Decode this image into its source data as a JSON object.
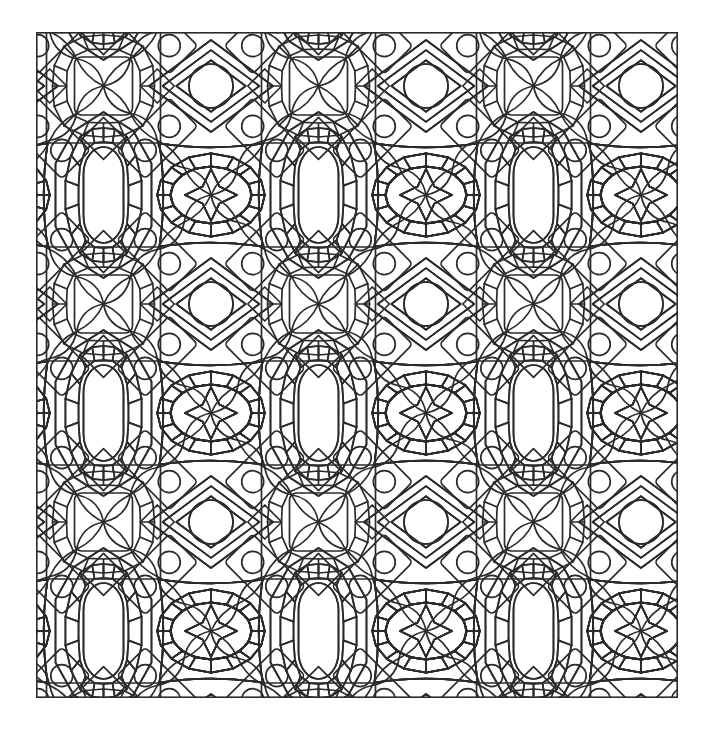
{
  "document": {
    "kind": "coloring-page",
    "title": "Geometric Tessellation Pattern",
    "canvas_width": 713,
    "canvas_height": 732,
    "background_color": "#ffffff"
  },
  "frame": {
    "x": 36,
    "y": 32,
    "width": 642,
    "height": 666,
    "stroke_color": "#2b2b2b",
    "stroke_width": 1.6,
    "fill": "none"
  },
  "artwork": {
    "style": "line-art outline, uncolored",
    "line_color": "#2b2b2b",
    "line_width": 1.7,
    "fill_color": "none",
    "symmetry": "p4m reflective lattice",
    "tile_width": 215,
    "tile_height": 218,
    "tile_origin_x": -40,
    "tile_origin_y": -55,
    "columns": 4,
    "rows": 4,
    "motifs": [
      {
        "name": "ellipse-medallion",
        "description": "horizontal oval ringed by trapezoid voussoirs inside a lobed square",
        "ellipse_rx": 40,
        "ellipse_ry": 28,
        "ring_segments": 16,
        "ring_thickness": 13,
        "lattice_offset_x": 0,
        "lattice_offset_y": 0
      },
      {
        "name": "square-medallion",
        "description": "rounded square panel ringed by brick voussoirs inside a square frame",
        "panel_half": 33,
        "ring_segments": 16,
        "ring_thickness": 14,
        "lattice_offset_x": 107.5,
        "lattice_offset_y": 109
      },
      {
        "name": "vertical-cartouche",
        "description": "tall capsule ringed by voussoirs, pointed top and bottom",
        "capsule_rx": 20,
        "capsule_ry": 48,
        "ring_segments": 18,
        "ring_thickness": 14,
        "lattice_offset_x": 107.5,
        "lattice_offset_y": 0
      },
      {
        "name": "diamond-with-circle",
        "description": "concentric diamonds enclosing a plain circle",
        "circle_r": 22,
        "diamond_half_w": 62,
        "diamond_half_h": 46,
        "rings": 2,
        "lattice_offset_x": 0,
        "lattice_offset_y": 109
      },
      {
        "name": "tilted-rectangle-two-circles",
        "description": "rectangle rotated 45 degrees containing two circles",
        "circle_r": 11,
        "rect_w": 74,
        "rect_h": 40,
        "count_per_tile": 4
      },
      {
        "name": "rope-braid",
        "description": "diagonal chain of teardrop lobes forming a twisted rope",
        "lobe_count": 4
      },
      {
        "name": "corner-star",
        "description": "four-pointed concave star filling lattice junctions"
      }
    ]
  }
}
